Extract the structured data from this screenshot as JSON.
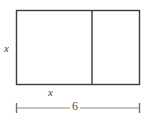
{
  "figure": {
    "type": "geometry-diagram",
    "labels": {
      "height_label": "x",
      "inner_width_label": "x",
      "total_width_label": "6"
    },
    "colors": {
      "shape_stroke": "#3c3c3c",
      "divider_stroke": "#3c3c3c",
      "dimension_stroke": "#8a8a8a",
      "text": "#3c3c3c",
      "background": "#ffffff"
    },
    "geometry": {
      "rect_left": 16,
      "rect_top": 10,
      "rect_right": 140,
      "rect_bottom": 85,
      "divider_x": 92,
      "dimension_y": 108,
      "dimension_left": 16,
      "dimension_right": 140,
      "tick_half_height": 5
    }
  }
}
